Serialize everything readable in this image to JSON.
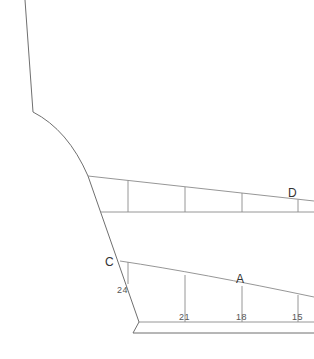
{
  "diagram": {
    "title": "",
    "point_labels": {
      "C": "C",
      "A": "A",
      "D": "D"
    },
    "measurements": {
      "m24": "24",
      "m21": "21",
      "m18": "18",
      "m15": "15"
    },
    "colors": {
      "line": "#6f6f6f",
      "text": "#333333",
      "background": "#ffffff"
    }
  }
}
